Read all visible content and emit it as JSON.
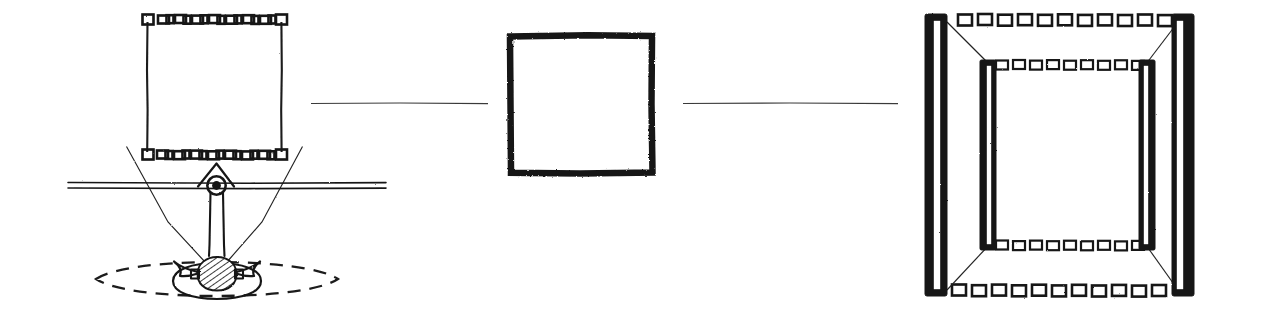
{
  "figure": {
    "background_color": "#ffffff",
    "ink_color": "#171717",
    "width": 1265,
    "height": 323,
    "style": "hand-drawn pen sketch, scanned line art, no text labels"
  },
  "panels": [
    {
      "id": "left",
      "name": "sensor-and-target-scene",
      "description": "Camera on a horizontal rail aimed downward at a hatched target object; field-of-view cone converges on the target; a dashed rectangular frame outlines the imaged region above the rail.",
      "elements": [
        {
          "name": "frame-top-dashed-edge",
          "kind": "dashed-box-row",
          "orientation": "horizontal",
          "dash_count": 11
        },
        {
          "name": "frame-bottom-dashed-edge",
          "kind": "dashed-box-row",
          "orientation": "horizontal",
          "dash_count": 13
        },
        {
          "name": "frame-left-solid-edge",
          "kind": "solid-line",
          "orientation": "vertical"
        },
        {
          "name": "frame-right-solid-edge",
          "kind": "solid-line",
          "orientation": "vertical"
        },
        {
          "name": "frame-corner-box-top-left",
          "kind": "corner-box"
        },
        {
          "name": "frame-corner-box-top-right",
          "kind": "corner-box"
        },
        {
          "name": "frame-corner-box-bottom-left",
          "kind": "corner-box"
        },
        {
          "name": "frame-corner-box-bottom-right",
          "kind": "corner-box"
        },
        {
          "name": "horizontal-rail",
          "kind": "double-rule",
          "orientation": "horizontal"
        },
        {
          "name": "camera-lens-node",
          "kind": "filled-circle-with-ring"
        },
        {
          "name": "camera-mount-bracket",
          "kind": "triangle"
        },
        {
          "name": "optical-axis-beam",
          "kind": "narrow-vertical-beam"
        },
        {
          "name": "field-of-view-left-ray",
          "kind": "sight-line"
        },
        {
          "name": "field-of-view-right-ray",
          "kind": "sight-line"
        },
        {
          "name": "target-object",
          "kind": "hatched-blob"
        },
        {
          "name": "target-wing-left",
          "kind": "curved-wing"
        },
        {
          "name": "target-wing-right",
          "kind": "curved-wing"
        },
        {
          "name": "target-base-ellipse",
          "kind": "ellipse"
        },
        {
          "name": "ground-region-dashed-outline",
          "kind": "dashed-ellipse"
        }
      ]
    },
    {
      "id": "center",
      "name": "image-plane-square",
      "description": "A single plain square drawn with a thick hand-inked stroke, representing the captured square image.",
      "elements": [
        {
          "name": "image-plane-square-outline",
          "kind": "thick-square"
        }
      ]
    },
    {
      "id": "right",
      "name": "projected-frustum-box",
      "description": "Perspective view of a rectangular frustum: two thick outer vertical panel bars at the near plane, two thinner inner vertical bars at the far plane, dashed-box rows forming top and bottom edges of both planes, and diagonal edges connecting near to far corners.",
      "elements": [
        {
          "name": "near-plane-left-bar",
          "kind": "thick-vertical-bar"
        },
        {
          "name": "near-plane-right-bar",
          "kind": "thick-vertical-bar"
        },
        {
          "name": "far-plane-left-bar",
          "kind": "thin-vertical-bar"
        },
        {
          "name": "far-plane-right-bar",
          "kind": "thin-vertical-bar"
        },
        {
          "name": "near-plane-top-dashed-edge",
          "kind": "dashed-box-row",
          "dash_count": 15
        },
        {
          "name": "near-plane-bottom-dashed-edge",
          "kind": "dashed-box-row",
          "dash_count": 16
        },
        {
          "name": "far-plane-top-dashed-edge",
          "kind": "dashed-box-row",
          "dash_count": 13
        },
        {
          "name": "far-plane-bottom-dashed-edge",
          "kind": "dashed-box-row",
          "dash_count": 13
        },
        {
          "name": "frustum-edge-top-left",
          "kind": "diagonal-edge"
        },
        {
          "name": "frustum-edge-top-right",
          "kind": "diagonal-edge"
        },
        {
          "name": "frustum-edge-bottom-left",
          "kind": "diagonal-edge"
        },
        {
          "name": "frustum-edge-bottom-right",
          "kind": "diagonal-edge"
        }
      ]
    }
  ],
  "connectors": [
    {
      "name": "connector-left-to-center",
      "kind": "thin-horizontal-line",
      "from_panel": "left",
      "to_panel": "center"
    },
    {
      "name": "connector-center-to-right",
      "kind": "thin-horizontal-line",
      "from_panel": "center",
      "to_panel": "right"
    }
  ]
}
